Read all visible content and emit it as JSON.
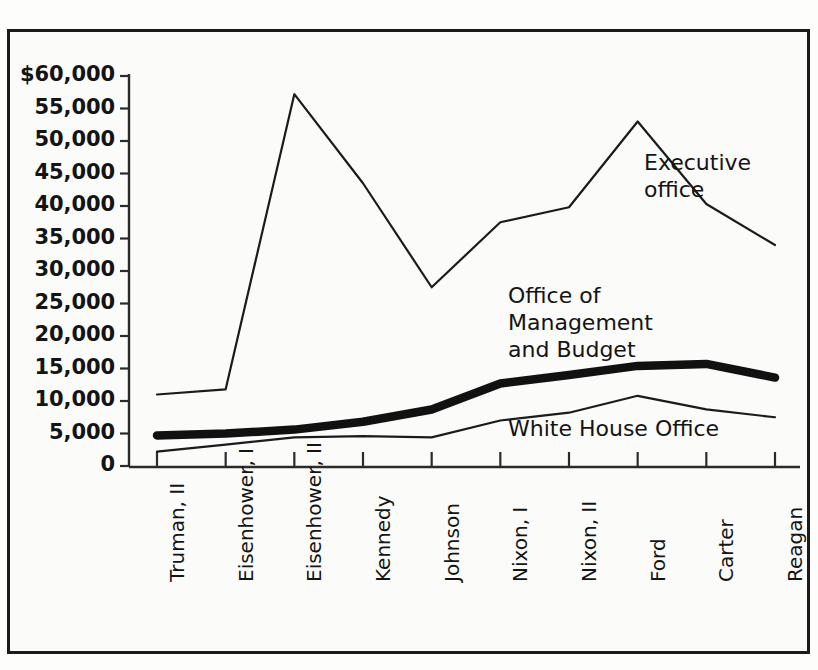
{
  "chart_data": {
    "type": "line",
    "title": "",
    "subtitle": "",
    "xlabel": "",
    "ylabel": "",
    "grid": false,
    "legend_position": "inline-annotations",
    "categories": [
      "Truman, II",
      "Eisenhower, I",
      "Eisenhower, II",
      "Kennedy",
      "Johnson",
      "Nixon, I",
      "Nixon, II",
      "Ford",
      "Carter",
      "Reagan"
    ],
    "ylim": [
      0,
      60000
    ],
    "ytick_labels": [
      "$60,000",
      "55,000",
      "50,000",
      "45,000",
      "40,000",
      "35,000",
      "30,000",
      "25,000",
      "20,000",
      "15,000",
      "10,000",
      "5,000",
      "0"
    ],
    "ytick_values": [
      60000,
      55000,
      50000,
      45000,
      40000,
      35000,
      30000,
      25000,
      20000,
      15000,
      10000,
      5000,
      0
    ],
    "series": [
      {
        "name": "Executive office",
        "style": "thin",
        "color": "#1b1b1b",
        "values": [
          11000,
          11800,
          57200,
          43500,
          27500,
          37500,
          39800,
          53000,
          40300,
          34000
        ]
      },
      {
        "name": "Office of Management and Budget",
        "style": "thick",
        "color": "#111111",
        "values": [
          4700,
          5000,
          5600,
          6800,
          8700,
          12700,
          14000,
          15400,
          15700,
          13600
        ]
      },
      {
        "name": "White House Office",
        "style": "thin",
        "color": "#1b1b1b",
        "values": [
          2200,
          3300,
          4400,
          4600,
          4400,
          7000,
          8200,
          10800,
          8700,
          7500
        ]
      }
    ],
    "annotations": [
      {
        "text": "Executive\noffice",
        "series": "Executive office"
      },
      {
        "text": "Office of\nManagement\nand Budget",
        "series": "Office of Management and Budget"
      },
      {
        "text": "White House Office",
        "series": "White House Office"
      }
    ]
  }
}
